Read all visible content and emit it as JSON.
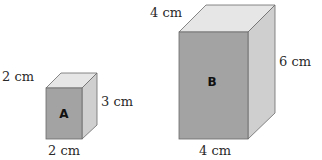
{
  "diagram": {
    "boxes": [
      {
        "id": "A",
        "label": "A",
        "depth_label": "2 cm",
        "height_label": "3 cm",
        "width_label": "2 cm",
        "colors": {
          "front": "#a3a3a3",
          "top": "#e6e6e6",
          "side": "#cfcfcf"
        }
      },
      {
        "id": "B",
        "label": "B",
        "depth_label": "4 cm",
        "height_label": "6 cm",
        "width_label": "4 cm",
        "colors": {
          "front": "#a3a3a3",
          "top": "#e6e6e6",
          "side": "#cfcfcf"
        }
      }
    ]
  }
}
